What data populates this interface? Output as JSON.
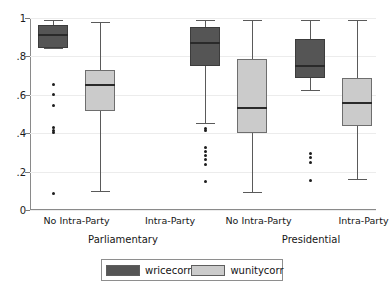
{
  "chart_data": {
    "type": "box",
    "title": "",
    "xlabel": "",
    "ylabel": "",
    "ylim": [
      0,
      1
    ],
    "grid": true,
    "legend_position": "bottom",
    "yticks": [
      "0",
      ".2",
      ".4",
      ".6",
      ".8",
      "1"
    ],
    "ytick_values": [
      0,
      0.2,
      0.4,
      0.6,
      0.8,
      1
    ],
    "series": [
      {
        "name": "wricecorr",
        "color": "#555555"
      },
      {
        "name": "wunitycorr",
        "color": "#cbcbcb"
      }
    ],
    "supergroups": [
      {
        "label": "Parliamentary",
        "categories": [
          "No Intra-Party",
          "Intra-Party"
        ]
      },
      {
        "label": "Presidential",
        "categories": [
          "No Intra-Party",
          "Intra-Party"
        ]
      }
    ],
    "boxes": [
      {
        "supergroup": "Parliamentary",
        "category": "No Intra-Party",
        "series": "wricecorr",
        "whisker_low": 0.845,
        "q1": 0.845,
        "median": 0.915,
        "q3": 0.965,
        "whisker_high": 0.99,
        "outliers": [
          0.655,
          0.6,
          0.545,
          0.43,
          0.415,
          0.405,
          0.085
        ]
      },
      {
        "supergroup": "Parliamentary",
        "category": "Intra-Party",
        "series": "wunitycorr",
        "whisker_low": 0.1,
        "q1": 0.515,
        "median": 0.655,
        "q3": 0.73,
        "whisker_high": 0.98,
        "outliers": []
      },
      {
        "supergroup": "Presidential",
        "category": "No Intra-Party",
        "series": "wricecorr",
        "whisker_low": 0.455,
        "q1": 0.75,
        "median": 0.875,
        "q3": 0.955,
        "whisker_high": 0.99,
        "outliers": [
          0.425,
          0.415,
          0.325,
          0.305,
          0.285,
          0.265,
          0.235,
          0.15
        ]
      },
      {
        "supergroup": "Presidential",
        "category": "No Intra-Party",
        "series": "wunitycorr",
        "whisker_low": 0.095,
        "q1": 0.4,
        "median": 0.535,
        "q3": 0.785,
        "whisker_high": 0.99,
        "outliers": []
      },
      {
        "supergroup": "Presidential",
        "category": "Intra-Party",
        "series": "wricecorr",
        "whisker_low": 0.625,
        "q1": 0.69,
        "median": 0.755,
        "q3": 0.89,
        "whisker_high": 0.99,
        "outliers": [
          0.295,
          0.275,
          0.25,
          0.155
        ]
      },
      {
        "supergroup": "Presidential",
        "category": "Intra-Party",
        "series": "wunitycorr",
        "whisker_low": 0.16,
        "q1": 0.435,
        "median": 0.565,
        "q3": 0.685,
        "whisker_high": 0.99,
        "outliers": []
      }
    ]
  },
  "legend": {
    "items": [
      {
        "label": "wricecorr",
        "color": "#555555"
      },
      {
        "label": "wunitycorr",
        "color": "#cbcbcb"
      }
    ]
  },
  "colors": {
    "dark": "#555555",
    "light": "#cbcbcb",
    "axis": "#8a8a8a",
    "grid": "#ececec",
    "text": "#161616"
  }
}
